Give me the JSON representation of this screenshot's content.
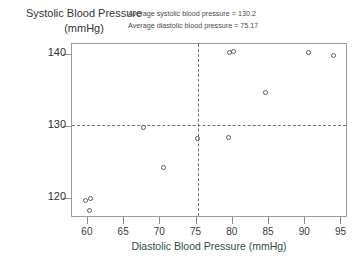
{
  "axes": {
    "ylabel_line1": "Systolic Blood Pressure",
    "ylabel_line2": "(mmHg)",
    "xlabel": "Diastolic Blood Pressure (mmHg)"
  },
  "annotations": {
    "line1": "Average systolic blood pressure = 130.2",
    "line2": "Average diastolic blood pressure = 75.17"
  },
  "chart_data": {
    "type": "scatter",
    "title": "",
    "xlabel": "Diastolic Blood Pressure (mmHg)",
    "ylabel": "Systolic Blood Pressure (mmHg)",
    "xlim": [
      57.8,
      95.9
    ],
    "ylim": [
      117.3,
      141.5
    ],
    "xticks": [
      60,
      65,
      70,
      75,
      80,
      85,
      90,
      95
    ],
    "yticks": [
      120,
      130,
      140
    ],
    "grid": false,
    "legend": null,
    "marker": "open-circle",
    "marker_color": "#5a5a5a",
    "points": [
      {
        "x": 59.8,
        "y": 119.7
      },
      {
        "x": 60.4,
        "y": 120.0
      },
      {
        "x": 60.3,
        "y": 118.3
      },
      {
        "x": 67.8,
        "y": 129.8
      },
      {
        "x": 70.5,
        "y": 124.2
      },
      {
        "x": 75.2,
        "y": 128.3
      },
      {
        "x": 79.5,
        "y": 128.4
      },
      {
        "x": 79.6,
        "y": 140.2
      },
      {
        "x": 80.1,
        "y": 140.4
      },
      {
        "x": 84.6,
        "y": 134.7
      },
      {
        "x": 90.5,
        "y": 140.2
      },
      {
        "x": 94.0,
        "y": 139.9
      }
    ],
    "reference_lines": [
      {
        "orientation": "horizontal",
        "value": 130.2,
        "style": "dashed",
        "label": "Average systolic blood pressure = 130.2"
      },
      {
        "orientation": "vertical",
        "value": 75.17,
        "style": "dashed",
        "label": "Average diastolic blood pressure = 75.17"
      }
    ]
  }
}
